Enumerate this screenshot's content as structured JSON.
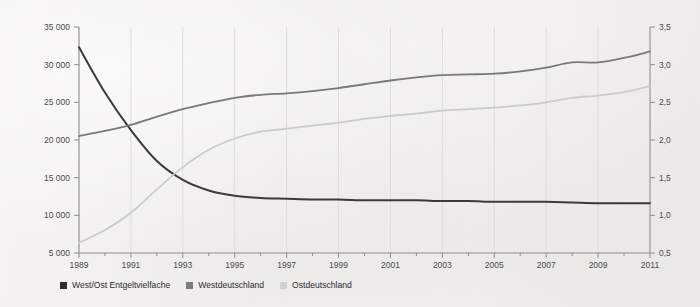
{
  "chart_data": {
    "type": "line",
    "title": "",
    "subtitle": "",
    "xlabel": "",
    "ylabel": "",
    "grid": true,
    "legend_position": "bottom-left",
    "x": [
      1989,
      1990,
      1991,
      1992,
      1993,
      1994,
      1995,
      1996,
      1997,
      1998,
      1999,
      2000,
      2001,
      2002,
      2003,
      2004,
      2005,
      2006,
      2007,
      2008,
      2009,
      2010,
      2011
    ],
    "x_tick_labels": [
      "1989",
      "1991",
      "1993",
      "1995",
      "1997",
      "1999",
      "2001",
      "2003",
      "2005",
      "2007",
      "2009",
      "2011"
    ],
    "x_tick_values": [
      1989,
      1991,
      1993,
      1995,
      1997,
      1999,
      2001,
      2003,
      2005,
      2007,
      2009,
      2011
    ],
    "xlim": [
      1989,
      2011
    ],
    "axes": {
      "left": {
        "label": "",
        "ylim": [
          5000,
          35000
        ],
        "ticks": [
          5000,
          10000,
          15000,
          20000,
          25000,
          30000,
          35000
        ],
        "tick_labels": [
          "5 000",
          "10 000",
          "15 000",
          "20 000",
          "25 000",
          "30 000",
          "35 000"
        ],
        "unit": ""
      },
      "right": {
        "label": "",
        "ylim": [
          0.5,
          3.5
        ],
        "ticks": [
          0.5,
          1.0,
          1.5,
          2.0,
          2.5,
          3.0,
          3.5
        ],
        "tick_labels": [
          "0,5",
          "1,0",
          "1,5",
          "2,0",
          "2,5",
          "3,0",
          "3,5"
        ],
        "unit": ""
      }
    },
    "series": [
      {
        "name": "West/Ost Entgeltvielfache",
        "axis": "right",
        "color": "#3a3a3a",
        "width": 2.0,
        "values": [
          3.23,
          2.63,
          2.13,
          1.72,
          1.47,
          1.33,
          1.26,
          1.23,
          1.22,
          1.21,
          1.21,
          1.2,
          1.2,
          1.2,
          1.19,
          1.19,
          1.18,
          1.18,
          1.18,
          1.17,
          1.16,
          1.16,
          1.16
        ],
        "values_left_scale": [
          11900,
          11700,
          11600,
          11600
        ]
      },
      {
        "name": "Westdeutschland",
        "axis": "left",
        "color": "#77797a",
        "width": 1.8,
        "values": [
          20530,
          21200,
          22000,
          23100,
          24100,
          24900,
          25600,
          26000,
          26200,
          26500,
          26900,
          27400,
          27900,
          28300,
          28600,
          28700,
          28800,
          29100,
          29600,
          30300,
          30300,
          30900,
          31750
        ]
      },
      {
        "name": "Ostdeutschland",
        "axis": "left",
        "color": "#c9cbcc",
        "width": 1.8,
        "values": [
          6350,
          8050,
          10350,
          13450,
          16400,
          18700,
          20200,
          21100,
          21500,
          21900,
          22300,
          22800,
          23200,
          23500,
          23900,
          24100,
          24300,
          24600,
          25000,
          25600,
          25900,
          26350,
          27150
        ]
      }
    ]
  },
  "legend": {
    "items": [
      {
        "label": "West/Ost Entgeltvielfache",
        "color": "#2e2e2e"
      },
      {
        "label": "Westdeutschland",
        "color": "#7b7d7e"
      },
      {
        "label": "Ostdeutschland",
        "color": "#cfd1d2"
      }
    ]
  },
  "colors": {
    "background": "#f2f1ef",
    "axis": "#8d8d8d",
    "grid": "#dedcd8",
    "text": "#4a4a4a"
  }
}
